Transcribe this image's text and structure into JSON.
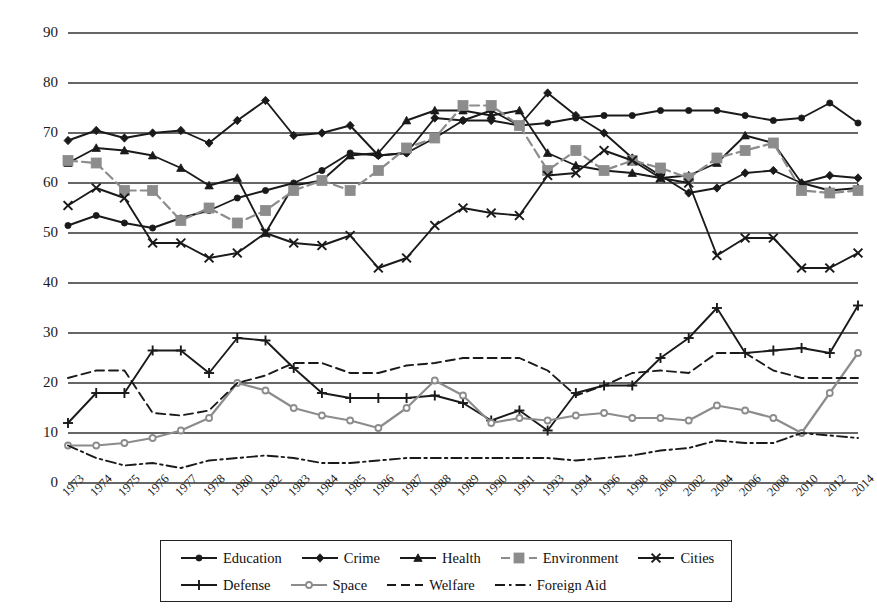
{
  "chart_data": {
    "type": "line",
    "title": "",
    "subtitle": "",
    "xlabel": "",
    "ylabel": "",
    "ylim": [
      0,
      90
    ],
    "ytick_values": [
      0,
      10,
      20,
      30,
      40,
      50,
      60,
      70,
      80,
      90
    ],
    "grid": "horizontal",
    "legend_position": "bottom",
    "x": [
      "1973",
      "1974",
      "1975",
      "1976",
      "1977",
      "1978",
      "1980",
      "1982",
      "1983",
      "1984",
      "1985",
      "1986",
      "1987",
      "1988",
      "1989",
      "1990",
      "1991",
      "1993",
      "1994",
      "1996",
      "1998",
      "2000",
      "2002",
      "2004",
      "2006",
      "2008",
      "2010",
      "2012",
      "2014"
    ],
    "series": [
      {
        "name": "Education",
        "marker": "circle",
        "line": "solid",
        "color": "#1a1a1a",
        "values": [
          51.5,
          53.5,
          52,
          51,
          53,
          54.5,
          57,
          58.5,
          60,
          62.5,
          66,
          65.5,
          66,
          69,
          72.5,
          74.5,
          71.5,
          72,
          73,
          73.5,
          73.5,
          74.5,
          74.5,
          74.5,
          73.5,
          72.5,
          73,
          76,
          72
        ]
      },
      {
        "name": "Crime",
        "marker": "diamond",
        "line": "solid",
        "color": "#1a1a1a",
        "values": [
          68.5,
          70.5,
          69,
          70,
          70.5,
          68,
          72.5,
          76.5,
          69.5,
          70,
          71.5,
          65.5,
          66,
          73,
          72.5,
          72.5,
          71.5,
          78,
          73.5,
          70,
          65,
          61.5,
          58,
          59,
          62,
          62.5,
          60,
          61.5,
          61
        ]
      },
      {
        "name": "Health",
        "marker": "triangle",
        "line": "solid",
        "color": "#1a1a1a",
        "values": [
          64,
          67,
          66.5,
          65.5,
          63,
          59.5,
          61,
          50,
          59.5,
          60.5,
          65.5,
          66,
          72.5,
          74.5,
          74.5,
          73.5,
          74.5,
          66,
          63.5,
          62.5,
          62,
          61,
          61.5,
          64,
          69.5,
          68,
          60,
          58.5,
          59
        ]
      },
      {
        "name": "Environment",
        "marker": "square",
        "line": "dashed",
        "color": "#8c8c8c",
        "values": [
          64.5,
          64,
          58.5,
          58.5,
          52.5,
          55,
          52,
          54.5,
          58.5,
          60.5,
          58.5,
          62.5,
          67,
          69,
          75.5,
          75.5,
          71.5,
          62.5,
          66.5,
          62.5,
          64.5,
          63,
          61,
          65,
          66.5,
          68,
          58.5,
          58,
          58.5
        ]
      },
      {
        "name": "Cities",
        "marker": "x",
        "line": "solid",
        "color": "#1a1a1a",
        "values": [
          55.5,
          59,
          57,
          48,
          48,
          45,
          46,
          50,
          48,
          47.5,
          49.5,
          43,
          45,
          51.5,
          55,
          54,
          53.5,
          61.5,
          62,
          66.5,
          64.5,
          61,
          60,
          45.5,
          49,
          49,
          43,
          43,
          46
        ]
      },
      {
        "name": "Defense",
        "marker": "plus",
        "line": "solid",
        "color": "#1a1a1a",
        "values": [
          12,
          18,
          18,
          26.5,
          26.5,
          22,
          29,
          28.5,
          23,
          18,
          17,
          17,
          17,
          17.5,
          16,
          12.5,
          14.5,
          10.5,
          18,
          19.5,
          19.5,
          25,
          29,
          35,
          26,
          26.5,
          27,
          26,
          35.5
        ]
      },
      {
        "name": "Space",
        "marker": "circle-open",
        "line": "solid",
        "color": "#8c8c8c",
        "values": [
          7.5,
          7.5,
          8,
          9,
          10.5,
          13,
          20,
          18.5,
          15,
          13.5,
          12.5,
          11,
          15,
          20.5,
          17.5,
          12,
          13,
          12.5,
          13.5,
          14,
          13,
          13,
          12.5,
          15.5,
          14.5,
          13,
          10,
          18,
          26
        ]
      },
      {
        "name": "Welfare",
        "marker": "none",
        "line": "dashed",
        "color": "#1a1a1a",
        "values": [
          21,
          22.5,
          22.5,
          14,
          13.5,
          14.5,
          20,
          21.5,
          24,
          24,
          22,
          22,
          23.5,
          24,
          25,
          25,
          25,
          22.5,
          17.5,
          19.5,
          22,
          22.5,
          22,
          26,
          26,
          22.5,
          21,
          21,
          21
        ]
      },
      {
        "name": "Foreign Aid",
        "marker": "none",
        "line": "dashdot",
        "color": "#1a1a1a",
        "values": [
          7.5,
          5,
          3.5,
          4,
          3,
          4.5,
          5,
          5.5,
          5,
          4,
          4,
          4.5,
          5,
          5,
          5,
          5,
          5,
          5,
          4.5,
          5,
          5.5,
          6.5,
          7,
          8.5,
          8,
          8,
          10,
          9.5,
          9
        ]
      }
    ]
  },
  "axis": {
    "ytick_labels": [
      "90",
      "80",
      "70",
      "60",
      "50",
      "40",
      "30",
      "20",
      "10",
      "0"
    ],
    "xtick_labels": [
      "1973",
      "1974",
      "1975",
      "1976",
      "1977",
      "1978",
      "1980",
      "1982",
      "1983",
      "1984",
      "1985",
      "1986",
      "1987",
      "1988",
      "1989",
      "1990",
      "1991",
      "1993",
      "1994",
      "1996",
      "1998",
      "2000",
      "2002",
      "2004",
      "2006",
      "2008",
      "2010",
      "2012",
      "2014"
    ]
  },
  "legend": {
    "rows": [
      [
        {
          "label": "Education",
          "marker": "circle",
          "line": "solid",
          "color": "#1a1a1a"
        },
        {
          "label": "Crime",
          "marker": "diamond",
          "line": "solid",
          "color": "#1a1a1a"
        },
        {
          "label": "Health",
          "marker": "triangle",
          "line": "solid",
          "color": "#1a1a1a"
        },
        {
          "label": "Environment",
          "marker": "square",
          "line": "dashed",
          "color": "#8c8c8c"
        },
        {
          "label": "Cities",
          "marker": "x",
          "line": "solid",
          "color": "#1a1a1a"
        }
      ],
      [
        {
          "label": "Defense",
          "marker": "plus",
          "line": "solid",
          "color": "#1a1a1a"
        },
        {
          "label": "Space",
          "marker": "circle-open",
          "line": "solid",
          "color": "#8c8c8c"
        },
        {
          "label": "Welfare",
          "marker": "none",
          "line": "dashed",
          "color": "#1a1a1a"
        },
        {
          "label": "Foreign Aid",
          "marker": "none",
          "line": "dashdot",
          "color": "#1a1a1a"
        }
      ]
    ]
  }
}
